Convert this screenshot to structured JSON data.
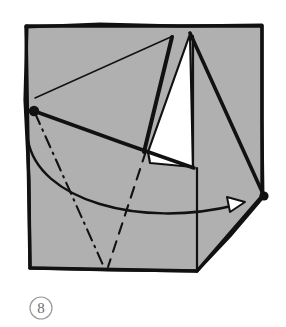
{
  "figure": {
    "kind": "origami-fold-diagram",
    "step_label": "8",
    "caption": "",
    "colors": {
      "paper_front": "#b0b0b0",
      "paper_back": "#ffffff",
      "ink": "#111111",
      "step_circle": "#9a9a9a",
      "step_text": "#6e6e6e",
      "background": "#ffffff"
    },
    "canvas": {
      "width": 286,
      "height": 327
    },
    "paper": {
      "name": "square-sheet",
      "outline": "26,26 262,26 262,196 197,271 30,268",
      "top_left": "26,26",
      "top_right": "262,26",
      "bottom_left": "30,268",
      "bottom_right_notch": "197,271",
      "right_point": "262,196"
    },
    "shapes": [
      {
        "name": "white-reverse-flap",
        "type": "polygon",
        "points": "190,34 148,152 150,163 193,167",
        "fill": "#ffffff"
      }
    ],
    "fold_lines": [
      {
        "name": "thick-fold-apex-left",
        "type": "thick-solid",
        "points": "172,37 144,152",
        "width": 4
      },
      {
        "name": "thick-fold-apex-right",
        "type": "thick-solid",
        "points": "190,33 264,196",
        "width": 3.6
      },
      {
        "name": "thick-fold-dot-to-right",
        "type": "thick-solid",
        "points": "34,111 194,168",
        "width": 3.6
      },
      {
        "name": "thin-crease-dot-to-apex",
        "type": "thin-solid",
        "points": "35,98 173,36",
        "width": 1.3
      },
      {
        "name": "vertical-edge-right-panel",
        "type": "thin-solid",
        "points": "197,168 197,271",
        "width": 2
      },
      {
        "name": "white-flap-inner-edge",
        "type": "thin-solid",
        "points": "193,167 193,36",
        "width": 2
      },
      {
        "name": "valley-crease-dashed",
        "type": "dashed",
        "points": "146,151 108,267",
        "width": 2
      },
      {
        "name": "mountain-crease-dash-dot",
        "type": "dash-dot",
        "points": "35,113 103,265",
        "width": 2
      }
    ],
    "arrows": [
      {
        "name": "fold-arrow-curved",
        "type": "curved-arrow",
        "path": "M28,140 C40,206 150,228 238,205",
        "head_points": "244,203 228,198 230,211",
        "head_fill": "#ffffff",
        "direction": "left-to-right"
      }
    ],
    "reference_points": [
      {
        "name": "corner-dot-left",
        "cx": 34,
        "cy": 111,
        "r": 5
      },
      {
        "name": "corner-dot-right",
        "cx": 264,
        "cy": 196,
        "r": 4.5
      }
    ],
    "step_badge": {
      "name": "step-number-badge",
      "cx": 41,
      "cy": 308,
      "r": 11
    }
  }
}
